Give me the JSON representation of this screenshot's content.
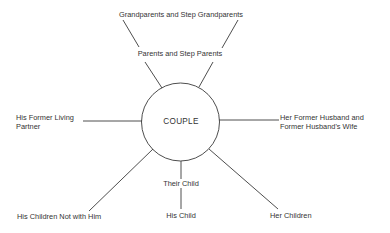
{
  "diagram": {
    "type": "ecomap",
    "center": {
      "label": "COUPLE"
    },
    "nodes": [
      {
        "id": "grandparents",
        "label": "Grandparents and Step Grandparents"
      },
      {
        "id": "parents",
        "label": "Parents and Step Parents"
      },
      {
        "id": "his-former-partner",
        "line1": "His Former Living",
        "line2": "Partner"
      },
      {
        "id": "her-former-husband",
        "line1": "Her Former Husband and",
        "line2": "Former Husband's Wife"
      },
      {
        "id": "their-child",
        "label": "Their Child"
      },
      {
        "id": "his-child",
        "label": "His Child"
      },
      {
        "id": "his-children-not-with-him",
        "label": "His Children Not with Him"
      },
      {
        "id": "her-children",
        "label": "Her Children"
      }
    ],
    "colors": {
      "line": "#3a3a3a",
      "text": "#333333",
      "background": "#ffffff"
    }
  }
}
